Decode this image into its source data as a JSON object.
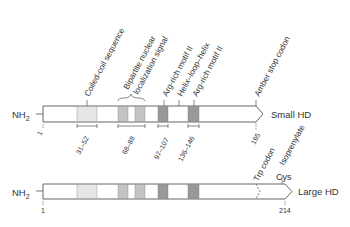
{
  "proteins": [
    {
      "name": "Small HD",
      "n_terminus": "NH2",
      "start": "1",
      "end": "195"
    },
    {
      "name": "Large HD",
      "n_terminus": "NH2",
      "start": "1",
      "end": "214"
    }
  ],
  "features": {
    "coiled_coil": {
      "label": "Coiled-coil sequence",
      "range": "31–52"
    },
    "nls": {
      "label_line1": "Bipartite nuclear",
      "label_line2": "localization signal",
      "range": "68–88"
    },
    "arg_rich_1": {
      "label": "Arg-rich motif II",
      "range": "97–107"
    },
    "helix_loop_helix": {
      "label": "Helix–loop–helix"
    },
    "arg_rich_2": {
      "label": "Arg-rich motif II",
      "range": "136–146"
    },
    "amber_stop": {
      "label": "Amber stop codon"
    },
    "trp_codon": {
      "label": "Trp codon"
    },
    "isoprenylate": {
      "label": "Isoprenylate"
    },
    "cys": {
      "label": "Cys"
    }
  },
  "colors": {
    "light": "#e6e6e6",
    "medium": "#c4c4c4",
    "dark": "#999999",
    "outline": "#555555"
  }
}
